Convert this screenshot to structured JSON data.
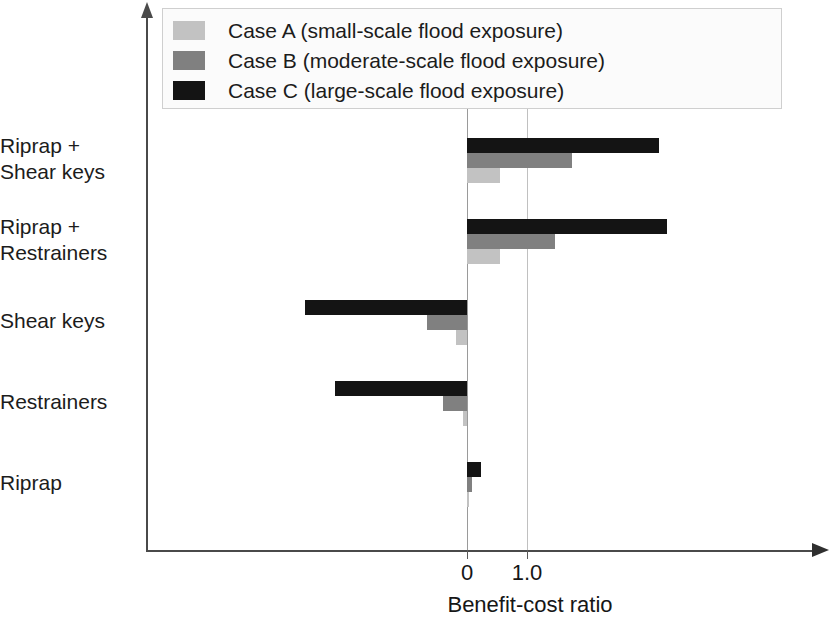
{
  "chart_data": {
    "type": "bar",
    "orientation": "horizontal",
    "title": "",
    "xlabel": "Benefit-cost ratio",
    "ylabel": "",
    "categories": [
      "Riprap",
      "Restrainers",
      "Shear keys",
      "Riprap +\nRestrainers",
      "Riprap +\nShear keys"
    ],
    "series": [
      {
        "name": "Case A (small-scale flood exposure)",
        "short": "Case A",
        "color": "#c2c2c2",
        "values": [
          0.03,
          -0.07,
          -0.18,
          0.55,
          0.55
        ]
      },
      {
        "name": "Case B (moderate-scale flood exposure)",
        "short": "Case B",
        "color": "#808080",
        "values": [
          0.08,
          -0.4,
          -0.67,
          1.47,
          1.75
        ]
      },
      {
        "name": "Case C (large-scale flood exposure)",
        "short": "Case C",
        "color": "#141414",
        "values": [
          0.23,
          -2.2,
          -2.7,
          3.33,
          3.2
        ]
      }
    ],
    "xticks": [
      {
        "label": "0",
        "value": 0
      },
      {
        "label": "1.0",
        "value": 1.0
      }
    ],
    "xlim": [
      -3.6,
      5.8
    ],
    "grid": "vertical-at-ticks",
    "legend_position": "top-center",
    "legend_entries": [
      "Case A (small-scale flood exposure)",
      "Case B (moderate-scale flood exposure)",
      "Case C (large-scale flood exposure)"
    ]
  },
  "axes": {
    "x_arrow_icon": "arrow-right-icon",
    "y_arrow_icon": "arrow-up-icon"
  }
}
